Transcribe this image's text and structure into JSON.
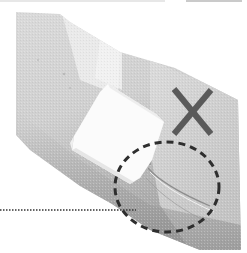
{
  "figure": {
    "subject": "Bandaged arm with gauze pad wrapped by a bandage",
    "annotations": {
      "incorrect_mark": {
        "symbol": "✕",
        "meaning": "incorrect",
        "color": "#5a5a5a"
      },
      "highlight_circle": {
        "style": "dashed",
        "color": "#2e2e2e",
        "highlights": "wrinkled bandage area"
      },
      "leader_line": {
        "style": "dotted",
        "color": "#333333"
      }
    },
    "colors": {
      "arm_light": "#e4e4e4",
      "arm_mid": "#c8c8c8",
      "arm_dark": "#9a9a9a",
      "gauze": "#fbfbfb",
      "background": "#ffffff"
    }
  }
}
